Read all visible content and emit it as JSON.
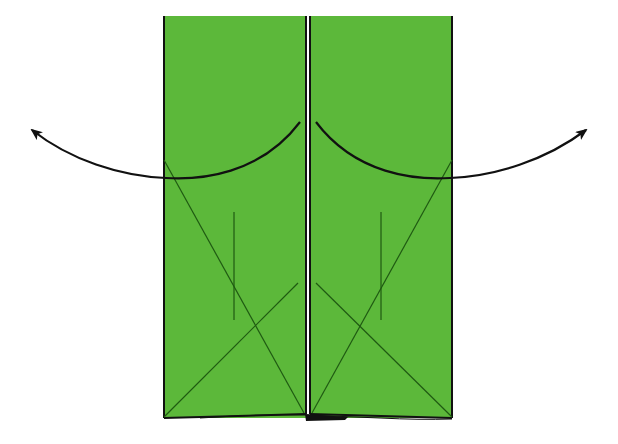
{
  "diagram": {
    "type": "origami-fold-diagram",
    "colors": {
      "paper": "#5cb83a",
      "outline": "#111111",
      "crease": "#1f5a12",
      "arrow": "#111111",
      "background": "#ffffff"
    },
    "panels": [
      {
        "name": "left-flap",
        "x": 164,
        "y": 16,
        "width": 142,
        "height": 402,
        "diagonals": [
          {
            "x1": 164,
            "y1": 417,
            "x2": 298,
            "y2": 283
          },
          {
            "x1": 164,
            "y1": 160,
            "x2": 304,
            "y2": 413
          }
        ],
        "vertical_crease": {
          "x": 234,
          "y1": 212,
          "y2": 320
        }
      },
      {
        "name": "right-flap",
        "x": 310,
        "y": 16,
        "width": 142,
        "height": 402,
        "diagonals": [
          {
            "x1": 452,
            "y1": 417,
            "x2": 316,
            "y2": 283
          },
          {
            "x1": 452,
            "y1": 160,
            "x2": 312,
            "y2": 413
          }
        ],
        "vertical_crease": {
          "x": 381,
          "y1": 212,
          "y2": 320
        }
      }
    ],
    "arrows": [
      {
        "name": "left-unfold-arrow",
        "direction": "left",
        "start": [
          300,
          122
        ],
        "end": [
          30,
          128
        ]
      },
      {
        "name": "right-unfold-arrow",
        "direction": "right",
        "start": [
          316,
          122
        ],
        "end": [
          588,
          128
        ]
      }
    ]
  }
}
